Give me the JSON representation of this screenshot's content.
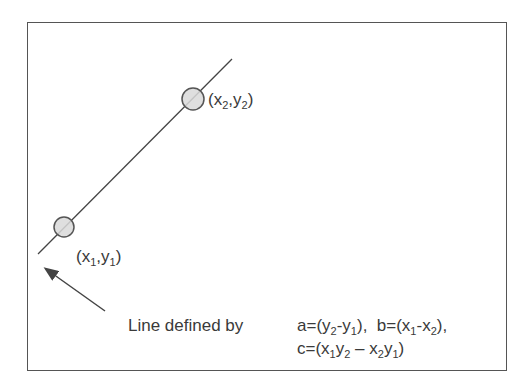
{
  "diagram": {
    "type": "line-through-two-points",
    "colors": {
      "stroke": "#444444",
      "point_fill": "#d9d9d9",
      "text": "#3a3a3a",
      "border": "#555555"
    },
    "line": {
      "x1": 38,
      "y1": 254,
      "x2": 232,
      "y2": 59
    },
    "points": [
      {
        "id": "p1",
        "cx": 64,
        "cy": 227,
        "r": 10,
        "label_var": "x",
        "label_var2": "y",
        "sub": "1"
      },
      {
        "id": "p2",
        "cx": 193,
        "cy": 99,
        "r": 11,
        "label_var": "x",
        "label_var2": "y",
        "sub": "2"
      }
    ],
    "arrow": {
      "from_x": 105,
      "from_y": 311,
      "to_x": 44,
      "to_y": 268
    },
    "caption": "Line defined by",
    "formula": {
      "a_prefix": "a=(y",
      "a_sub1": "2",
      "a_mid": "-y",
      "a_sub2": "1",
      "a_suffix": "),",
      "b_prefix": "b=(x",
      "b_sub1": "1",
      "b_mid": "-x",
      "b_sub2": "2",
      "b_suffix": "),",
      "c_prefix": "c=(x",
      "c_sub1": "1",
      "c_y": "y",
      "c_sub2": "2",
      "c_mid": " – x",
      "c_sub3": "2",
      "c_y2": "y",
      "c_sub4": "1",
      "c_suffix": ")"
    },
    "labels": {
      "p1": {
        "open": "(x",
        "sub": "1",
        "comma": ",y",
        "sub2": "1",
        "close": ")"
      },
      "p2": {
        "open": "(x",
        "sub": "2",
        "comma": ",y",
        "sub2": "2",
        "close": ")"
      }
    }
  }
}
